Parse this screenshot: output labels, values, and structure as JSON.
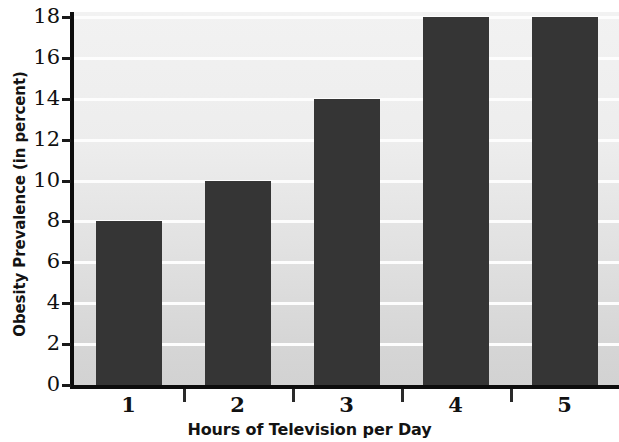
{
  "chart_data": {
    "type": "bar",
    "title": "",
    "xlabel": "Hours of Television per Day",
    "ylabel": "Obesity Prevalence (in percent)",
    "categories": [
      "1",
      "2",
      "3",
      "4",
      "5"
    ],
    "values": [
      8,
      10,
      14,
      18,
      18
    ],
    "series": [
      {
        "name": "Obesity Prevalence",
        "values": [
          8,
          10,
          14,
          18,
          18
        ]
      }
    ],
    "ylim": [
      0,
      18
    ],
    "xlim_note": "categorical",
    "y_ticks": [
      "0",
      "2",
      "4",
      "6",
      "8",
      "10",
      "12",
      "14",
      "16",
      "18"
    ],
    "y_tick_values": [
      0,
      2,
      4,
      6,
      8,
      10,
      12,
      14,
      16,
      18
    ],
    "x_ticks": [
      "1",
      "2",
      "3",
      "4",
      "5"
    ],
    "grid": "horizontal-white-gridlines",
    "legend": "none",
    "legend_position": "none",
    "bar_color": "#353535",
    "plot_background": "#e9e9e9",
    "gridline_color": "#fdfdfd",
    "axis_color": "#0d0d0d",
    "text_color": "#111111"
  }
}
